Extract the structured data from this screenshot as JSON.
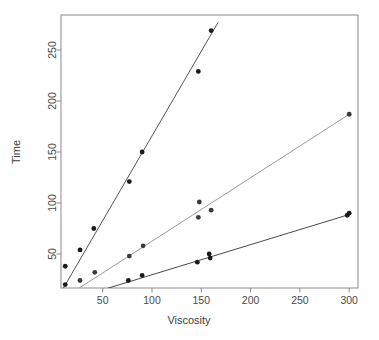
{
  "chart_data": {
    "type": "scatter",
    "title": "",
    "subtitle": "",
    "xlabel": "Viscosity",
    "ylabel": "Time",
    "xlim": [
      8,
      309
    ],
    "ylim": [
      10,
      287
    ],
    "xticks": [
      50,
      100,
      150,
      200,
      250,
      300
    ],
    "yticks": [
      50,
      100,
      150,
      200,
      250
    ],
    "grid": false,
    "legend": "none",
    "annotations": [],
    "series": [
      {
        "name": "steep-series",
        "marker": "filled-circle",
        "color": "#1a1a1a",
        "line_color": "#555555",
        "slope": 1.66,
        "intercept": 0.0,
        "fit_x": [
          8,
          167
        ],
        "fit_y": [
          13,
          277
        ],
        "points": [
          {
            "x": 12,
            "y": 38
          },
          {
            "x": 12,
            "y": 20
          },
          {
            "x": 27,
            "y": 54
          },
          {
            "x": 41,
            "y": 75
          },
          {
            "x": 77,
            "y": 121
          },
          {
            "x": 90,
            "y": 150
          },
          {
            "x": 147,
            "y": 229
          },
          {
            "x": 160,
            "y": 269
          }
        ]
      },
      {
        "name": "middle-series",
        "marker": "filled-circle",
        "color": "#3a3a3a",
        "line_color": "#999999",
        "slope": 0.625,
        "intercept": 0.0,
        "fit_x": [
          22,
          300
        ],
        "fit_y": [
          14,
          187
        ],
        "points": [
          {
            "x": 27,
            "y": 24
          },
          {
            "x": 42,
            "y": 32
          },
          {
            "x": 77,
            "y": 48
          },
          {
            "x": 91,
            "y": 58
          },
          {
            "x": 147,
            "y": 86
          },
          {
            "x": 148,
            "y": 101
          },
          {
            "x": 160,
            "y": 93
          },
          {
            "x": 300,
            "y": 187
          }
        ]
      },
      {
        "name": "shallow-series",
        "marker": "filled-circle",
        "color": "#1a1a1a",
        "line_color": "#4a4a4a",
        "slope": 0.297,
        "intercept": 0.0,
        "fit_x": [
          30,
          301
        ],
        "fit_y": [
          9,
          89
        ],
        "points": [
          {
            "x": 76,
            "y": 24
          },
          {
            "x": 90,
            "y": 29
          },
          {
            "x": 146,
            "y": 42
          },
          {
            "x": 158,
            "y": 50
          },
          {
            "x": 159,
            "y": 46
          },
          {
            "x": 298,
            "y": 88
          },
          {
            "x": 300,
            "y": 90
          }
        ]
      }
    ]
  },
  "axes": {
    "x_title": "Viscosity",
    "y_title": "Time",
    "x_tick_labels": [
      "50",
      "100",
      "150",
      "200",
      "250",
      "300"
    ],
    "y_tick_labels": [
      "50",
      "100",
      "150",
      "200",
      "250"
    ]
  },
  "colors": {
    "frame": "#8a8a8a",
    "text": "#4a4a4a",
    "marker": "#1a1a1a",
    "background": "#ffffff"
  }
}
